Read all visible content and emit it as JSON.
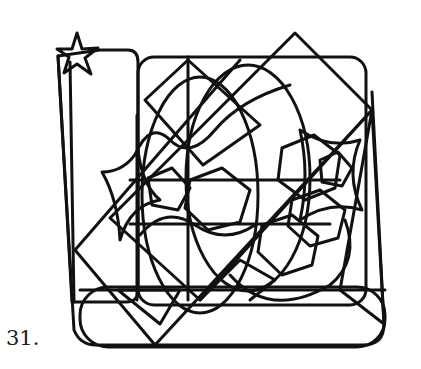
{
  "item_label": "31.",
  "figure": {
    "stroke_color": "#111111",
    "stroke_width": 3,
    "background": "#ffffff",
    "shapes": [
      {
        "name": "tall-rounded-tab",
        "type": "path",
        "d": "M58,56 L100,50 L128,50 Q138,50 138,62 L138,290 Q138,302 126,302 L72,302 Z"
      },
      {
        "name": "tall-tab-inner-line",
        "type": "line",
        "x1": 70,
        "y1": 62,
        "x2": 74,
        "y2": 302
      },
      {
        "name": "star-top-left",
        "type": "path",
        "d": "M77,33 L82,49 L98,48 L85,58 L91,74 L77,64 L64,73 L69,57 L57,49 L72,49 Z"
      },
      {
        "name": "big-rounded-square",
        "type": "rect",
        "x": 138,
        "y": 57,
        "width": 228,
        "height": 248,
        "rx": 16
      },
      {
        "name": "bottom-rounded-bar",
        "type": "rect",
        "x": 80,
        "y": 287,
        "width": 305,
        "height": 60,
        "rx": 28
      },
      {
        "name": "left-slanted-frame",
        "type": "path",
        "d": "M58,56 L74,330 Q80,345 96,345 L363,345 Q384,345 384,324 L372,92"
      },
      {
        "name": "big-ellipse-left",
        "type": "ellipse",
        "cx": 200,
        "cy": 195,
        "rx": 58,
        "ry": 118
      },
      {
        "name": "big-ellipse-right",
        "type": "ellipse",
        "cx": 248,
        "cy": 178,
        "rx": 62,
        "ry": 113
      },
      {
        "name": "big-diamond",
        "type": "path",
        "d": "M295,33 L372,110 L200,300 L110,218 Z"
      },
      {
        "name": "diagonal-square",
        "type": "path",
        "d": "M188,60 L260,125 L203,165 L145,100 Z"
      },
      {
        "name": "long-diagonal-1",
        "type": "line",
        "x1": 75,
        "y1": 250,
        "x2": 240,
        "y2": 60
      },
      {
        "name": "long-diagonal-2",
        "type": "line",
        "x1": 75,
        "y1": 250,
        "x2": 155,
        "y2": 345
      },
      {
        "name": "long-diagonal-3",
        "type": "line",
        "x1": 155,
        "y1": 345,
        "x2": 372,
        "y2": 110
      },
      {
        "name": "vertical-line-center",
        "type": "line",
        "x1": 188,
        "y1": 57,
        "x2": 188,
        "y2": 300
      },
      {
        "name": "vertical-line-left",
        "type": "line",
        "x1": 137,
        "y1": 115,
        "x2": 137,
        "y2": 300
      },
      {
        "name": "horizontal-line-mid",
        "type": "line",
        "x1": 130,
        "y1": 180,
        "x2": 340,
        "y2": 180
      },
      {
        "name": "horizontal-line-low",
        "type": "line",
        "x1": 130,
        "y1": 224,
        "x2": 330,
        "y2": 224
      },
      {
        "name": "horizontal-line-bottom",
        "type": "line",
        "x1": 80,
        "y1": 290,
        "x2": 385,
        "y2": 290
      },
      {
        "name": "down-triangle",
        "type": "path",
        "d": "M118,290 L180,290 L160,324 Z"
      },
      {
        "name": "concave-star-left",
        "type": "path",
        "d": "M102,172 Q125,172 138,150 Q142,185 160,200 Q130,205 120,240 Q118,200 102,172 Z"
      },
      {
        "name": "wavy-curve-top",
        "type": "path",
        "d": "M135,155 Q150,120 170,140 Q190,160 215,130 Q240,100 290,85"
      },
      {
        "name": "wavy-curve-mid",
        "type": "path",
        "d": "M140,235 Q165,205 195,225 Q225,245 255,225"
      },
      {
        "name": "hexagon-center",
        "type": "path",
        "d": "M190,180 L222,168 L250,190 L240,222 L208,230 L185,208 Z"
      },
      {
        "name": "hexagon-right-1",
        "type": "path",
        "d": "M282,148 L314,135 L340,155 L335,188 L305,200 L278,180 Z"
      },
      {
        "name": "hexagon-right-2",
        "type": "path",
        "d": "M292,200 L320,190 L345,210 L338,238 L310,246 L288,226 Z"
      },
      {
        "name": "hexagon-right-3",
        "type": "path",
        "d": "M262,225 L292,215 L318,236 L312,265 L282,275 L258,252 Z"
      },
      {
        "name": "small-pentagon-right",
        "type": "path",
        "d": "M320,160 L338,152 L352,168 L342,186 L322,182 Z"
      },
      {
        "name": "lower-right-arc",
        "type": "path",
        "d": "M230,275 Q270,320 330,285 Q360,260 345,220"
      },
      {
        "name": "right-concave-shape",
        "type": "path",
        "d": "M300,130 Q330,150 360,140 Q345,175 362,210 Q330,200 300,220 Q310,175 300,130 Z"
      },
      {
        "name": "right-triangle-edge",
        "type": "path",
        "d": "M372,110 L384,324 L340,290 Z"
      },
      {
        "name": "small-inner-pentagon",
        "type": "path",
        "d": "M148,178 L172,168 L190,188 L178,210 L152,205 Z"
      },
      {
        "name": "bottom-center-zigzag",
        "type": "path",
        "d": "M200,300 L240,260 L275,280 L250,300"
      }
    ]
  }
}
